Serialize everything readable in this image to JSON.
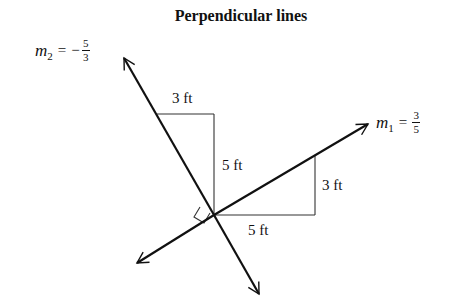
{
  "title": "Perpendicular lines",
  "line1": {
    "name": "m",
    "subscript": "1",
    "equals": "=",
    "sign": "",
    "numerator": "3",
    "denominator": "5"
  },
  "line2": {
    "name": "m",
    "subscript": "2",
    "equals": "=",
    "sign": "−",
    "numerator": "5",
    "denominator": "3"
  },
  "triangle_upper": {
    "run_label": "3 ft",
    "rise_label": "5 ft"
  },
  "triangle_lower": {
    "run_label": "5 ft",
    "rise_label": "3 ft"
  },
  "colors": {
    "stroke": "#111111",
    "triangle_stroke": "#333333",
    "background": "#ffffff"
  }
}
